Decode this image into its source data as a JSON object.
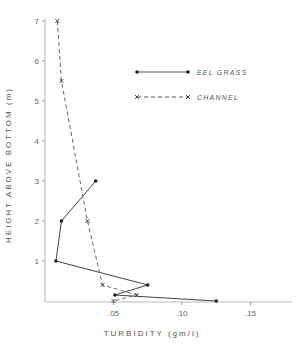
{
  "chart_data": {
    "type": "line",
    "title": "",
    "xlabel": "TURBIDITY   (gm/l)",
    "ylabel": "HEIGHT ABOVE BOTTOM  (m)",
    "xlim": [
      0,
      0.18
    ],
    "ylim": [
      0,
      7
    ],
    "x_ticks": [
      0.05,
      0.1,
      0.15
    ],
    "x_tick_labels": [
      ".05",
      ".10",
      ".15"
    ],
    "y_ticks": [
      1,
      2,
      3,
      4,
      5,
      6,
      7
    ],
    "y_tick_labels": [
      "1",
      "2",
      "3",
      "4",
      "5",
      "6",
      "7"
    ],
    "grid": false,
    "legend_position": "upper right",
    "series": [
      {
        "name": "EEL GRASS",
        "style": "solid",
        "marker": "dot",
        "points": [
          [
            0.037,
            3.0
          ],
          [
            0.012,
            2.0
          ],
          [
            0.008,
            1.0
          ],
          [
            0.075,
            0.4
          ],
          [
            0.051,
            0.15
          ],
          [
            0.125,
            0.0
          ]
        ]
      },
      {
        "name": "CHANNEL",
        "style": "dashed",
        "marker": "x",
        "points": [
          [
            0.009,
            7.0
          ],
          [
            0.012,
            5.5
          ],
          [
            0.031,
            2.0
          ],
          [
            0.042,
            0.4
          ],
          [
            0.067,
            0.15
          ],
          [
            0.05,
            0.0
          ]
        ]
      }
    ]
  }
}
